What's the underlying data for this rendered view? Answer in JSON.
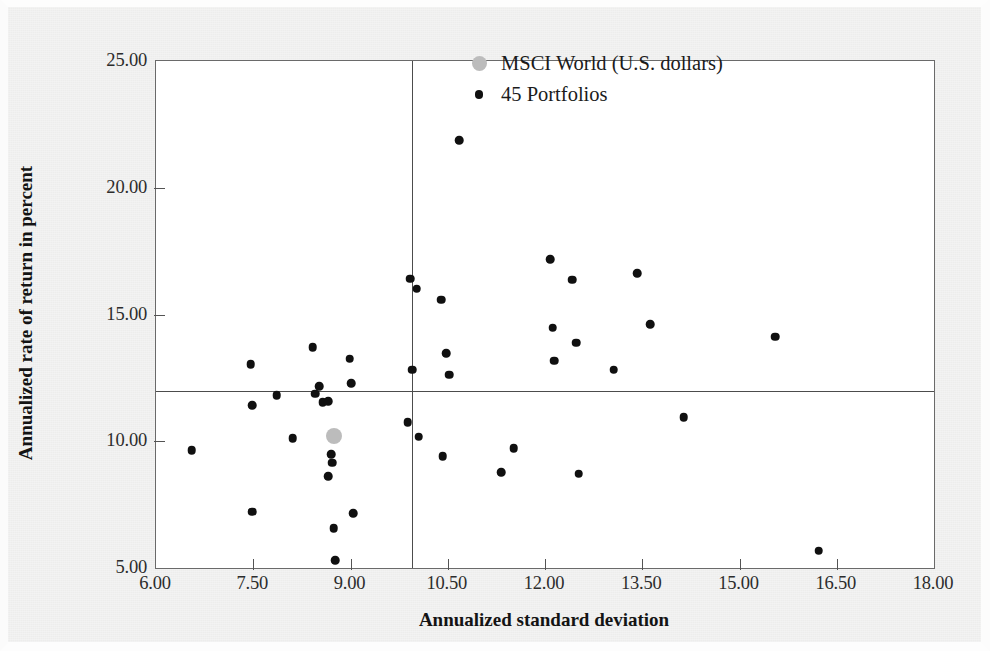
{
  "chart_data": {
    "type": "scatter",
    "title": "",
    "xlabel": "Annualized standard deviation",
    "ylabel": "Annualized rate of return in percent",
    "xlim": [
      6.0,
      18.0
    ],
    "ylim": [
      5.0,
      25.0
    ],
    "xticks": [
      "6.00",
      "7.50",
      "9.00",
      "10.50",
      "12.00",
      "13.50",
      "15.00",
      "16.50",
      "18.00"
    ],
    "xtick_values": [
      6.0,
      7.5,
      9.0,
      10.5,
      12.0,
      13.5,
      15.0,
      16.5,
      18.0
    ],
    "yticks": [
      "5.00",
      "10.00",
      "15.00",
      "20.00",
      "25.00"
    ],
    "ytick_values": [
      5.0,
      10.0,
      15.0,
      20.0,
      25.0
    ],
    "grid": false,
    "legend_position": "top-right",
    "reference_lines": {
      "horizontal_y": 11.97,
      "vertical_x": 9.95
    },
    "series": [
      {
        "name": "MSCI World (U.S. dollars)",
        "marker": "circle",
        "color": "#bcbcbc",
        "size": "large",
        "points": [
          {
            "x": 8.75,
            "y": 10.2
          }
        ]
      },
      {
        "name": "45 Portfolios",
        "marker": "circle",
        "color": "#101010",
        "size": "small",
        "points": [
          {
            "x": 6.55,
            "y": 9.65
          },
          {
            "x": 7.46,
            "y": 13.05
          },
          {
            "x": 7.48,
            "y": 11.42
          },
          {
            "x": 7.48,
            "y": 7.22
          },
          {
            "x": 7.86,
            "y": 11.82
          },
          {
            "x": 8.11,
            "y": 10.12
          },
          {
            "x": 8.42,
            "y": 13.72
          },
          {
            "x": 8.46,
            "y": 11.88
          },
          {
            "x": 8.52,
            "y": 12.18
          },
          {
            "x": 8.57,
            "y": 11.55
          },
          {
            "x": 8.66,
            "y": 11.58
          },
          {
            "x": 8.66,
            "y": 8.62
          },
          {
            "x": 8.7,
            "y": 9.48
          },
          {
            "x": 8.72,
            "y": 9.15
          },
          {
            "x": 8.74,
            "y": 6.58
          },
          {
            "x": 8.76,
            "y": 5.3
          },
          {
            "x": 8.99,
            "y": 13.25
          },
          {
            "x": 9.01,
            "y": 12.28
          },
          {
            "x": 9.04,
            "y": 7.15
          },
          {
            "x": 9.88,
            "y": 10.75
          },
          {
            "x": 9.92,
            "y": 16.42
          },
          {
            "x": 9.95,
            "y": 12.82
          },
          {
            "x": 10.02,
            "y": 16.02
          },
          {
            "x": 10.05,
            "y": 10.18
          },
          {
            "x": 10.4,
            "y": 15.58
          },
          {
            "x": 10.42,
            "y": 9.42
          },
          {
            "x": 10.48,
            "y": 13.48
          },
          {
            "x": 10.52,
            "y": 12.62
          },
          {
            "x": 10.68,
            "y": 21.88
          },
          {
            "x": 11.32,
            "y": 8.78
          },
          {
            "x": 11.52,
            "y": 9.72
          },
          {
            "x": 12.08,
            "y": 17.18
          },
          {
            "x": 12.12,
            "y": 14.48
          },
          {
            "x": 12.14,
            "y": 13.18
          },
          {
            "x": 12.42,
            "y": 16.38
          },
          {
            "x": 12.48,
            "y": 13.88
          },
          {
            "x": 12.52,
            "y": 8.72
          },
          {
            "x": 13.06,
            "y": 12.82
          },
          {
            "x": 13.42,
            "y": 16.62
          },
          {
            "x": 13.62,
            "y": 14.62
          },
          {
            "x": 14.14,
            "y": 10.95
          },
          {
            "x": 15.55,
            "y": 14.12
          },
          {
            "x": 16.22,
            "y": 5.68
          }
        ]
      }
    ]
  },
  "legend": {
    "entries": [
      {
        "label": "MSCI World (U.S. dollars)",
        "swatch": "benchmark-marker"
      },
      {
        "label": "45 Portfolios",
        "swatch": "portfolio-marker"
      }
    ]
  }
}
